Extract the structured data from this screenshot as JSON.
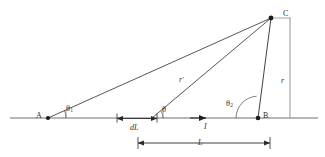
{
  "figure": {
    "type": "geometry-diagram",
    "points": {
      "A": {
        "label": "A",
        "x": 48,
        "y": 118
      },
      "B": {
        "label": "B",
        "x": 258,
        "y": 118
      },
      "C": {
        "label": "C",
        "x": 272,
        "y": 17
      },
      "element": {
        "x": 152,
        "y": 118
      }
    },
    "angles": [
      {
        "name": "theta-1",
        "label": "θ",
        "subscript": "1",
        "vertex": "A",
        "x": 66,
        "y": 104
      },
      {
        "name": "theta",
        "label": "θ",
        "subscript": "",
        "vertex": "element",
        "x": 162,
        "y": 105
      },
      {
        "name": "theta-2",
        "label": "θ",
        "subscript": "2",
        "vertex": "B",
        "x": 226,
        "y": 99
      }
    ],
    "lengths": [
      {
        "name": "r-prime",
        "label": "r",
        "prime": "′",
        "x": 179,
        "y": 76
      },
      {
        "name": "r",
        "label": "r",
        "prime": "",
        "x": 281,
        "y": 77
      },
      {
        "name": "dL",
        "label": "dL",
        "x": 130,
        "y": 124
      },
      {
        "name": "L",
        "label": "L",
        "x": 198,
        "y": 139
      }
    ],
    "current": {
      "name": "current",
      "label": "I",
      "x": 204,
      "y": 123
    },
    "colors": {
      "line": "#2b2b2b",
      "axis": "#6b6b6b",
      "text": "#333333",
      "background": "#ffffff"
    }
  }
}
